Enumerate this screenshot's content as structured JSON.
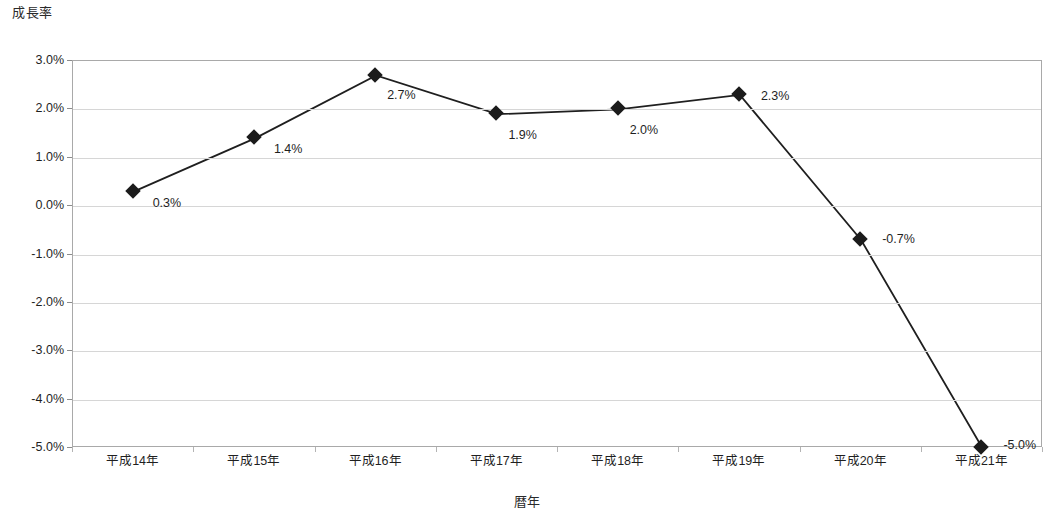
{
  "chart_data": {
    "type": "line",
    "title": "",
    "ylabel": "成長率",
    "xlabel": "暦年",
    "categories": [
      "平成14年",
      "平成15年",
      "平成16年",
      "平成17年",
      "平成18年",
      "平成19年",
      "平成20年",
      "平成21年"
    ],
    "values": [
      0.3,
      1.4,
      2.7,
      1.9,
      2.0,
      2.3,
      -0.7,
      -5.0
    ],
    "data_labels": [
      "0.3%",
      "1.4%",
      "2.7%",
      "1.9%",
      "2.0%",
      "2.3%",
      "-0.7%",
      "-5.0%"
    ],
    "ylim": [
      -5.0,
      3.0
    ],
    "ytick_values": [
      3.0,
      2.0,
      1.0,
      0.0,
      -1.0,
      -2.0,
      -3.0,
      -4.0,
      -5.0
    ],
    "ytick_labels": [
      "3.0%",
      "2.0%",
      "1.0%",
      "0.0%",
      "-1.0%",
      "-2.0%",
      "-3.0%",
      "-4.0%",
      "-5.0%"
    ],
    "grid": true,
    "legend": false,
    "legend_position": "none",
    "series": [
      {
        "name": "成長率",
        "marker": "diamond",
        "marker_color": "#1b1b1b",
        "line_color": "#1f1f1f",
        "values": [
          0.3,
          1.4,
          2.7,
          1.9,
          2.0,
          2.3,
          -0.7,
          -5.0
        ]
      }
    ],
    "label_offsets": [
      {
        "dx": 20,
        "dy": 12
      },
      {
        "dx": 20,
        "dy": 12
      },
      {
        "dx": 12,
        "dy": 20
      },
      {
        "dx": 12,
        "dy": 22
      },
      {
        "dx": 12,
        "dy": 22
      },
      {
        "dx": 22,
        "dy": 2
      },
      {
        "dx": 22,
        "dy": 0
      },
      {
        "dx": 22,
        "dy": -2
      }
    ]
  },
  "colors": {
    "plot_border": "#a9a9a9",
    "gridline": "#d6d6d6",
    "series": "#1f1f1f",
    "text": "#1f1f1f",
    "background": "#ffffff"
  }
}
